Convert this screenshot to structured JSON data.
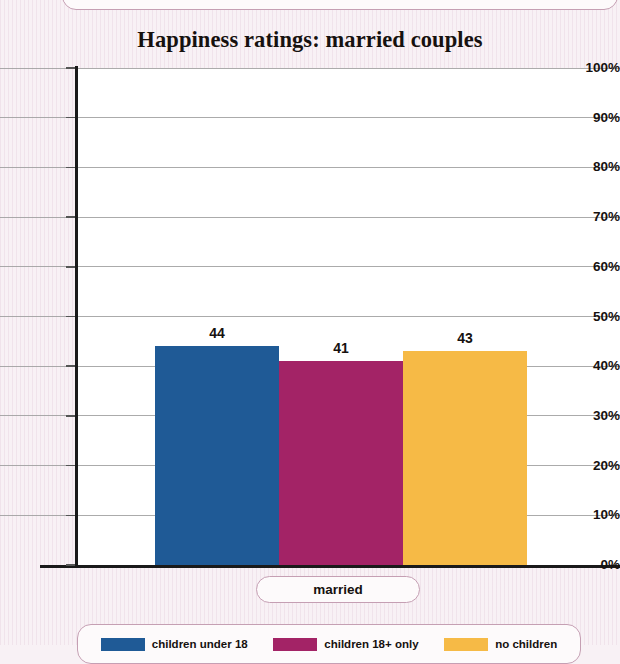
{
  "chart_data": {
    "type": "bar",
    "title": "Happiness ratings: married couples",
    "xlabel": "",
    "ylabel": "",
    "categories": [
      "married"
    ],
    "series": [
      {
        "name": "children under 18",
        "values": [
          44
        ],
        "color": "#1f5a96"
      },
      {
        "name": "children 18+ only",
        "values": [
          41
        ],
        "color": "#a32366"
      },
      {
        "name": "no children",
        "values": [
          43
        ],
        "color": "#f6ba46"
      }
    ],
    "ylim": [
      0,
      100
    ],
    "y_ticks": [
      "100%",
      "90%",
      "80%",
      "70%",
      "60%",
      "50%",
      "40%",
      "30%",
      "20%",
      "10%",
      "0%"
    ],
    "y_tick_values": [
      100,
      90,
      80,
      70,
      60,
      50,
      40,
      30,
      20,
      10,
      0
    ],
    "value_labels": [
      "44",
      "41",
      "43"
    ],
    "grid": true,
    "legend_position": "bottom"
  },
  "legend": {
    "items": [
      {
        "label": "children under 18",
        "color": "#1f5a96"
      },
      {
        "label": "children 18+ only",
        "color": "#a32366"
      },
      {
        "label": "no children",
        "color": "#f6ba46"
      }
    ]
  },
  "x_axis": {
    "category_label": "married"
  },
  "colors": {
    "page_background": "#f8f1f5",
    "plot_background": "#ffffff",
    "axis": "#1a1a1a",
    "gridline": "#9c9c9c",
    "pill_border": "#c59fb3",
    "series_blue": "#1f5a96",
    "series_magenta": "#a32366",
    "series_amber": "#f6ba46"
  }
}
